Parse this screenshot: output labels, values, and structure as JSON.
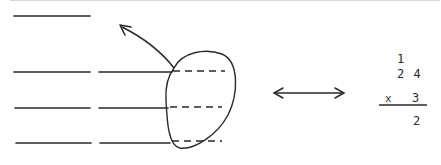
{
  "diagram": {
    "stroke_color": "#2a2a2a",
    "lines": {
      "top_single": 1,
      "rows": 3,
      "row_segments_each": 2,
      "dashed_inside_loop": 3
    },
    "arrows": {
      "curved": "up-left out of loop",
      "double": "equivalence left-right"
    },
    "multiplication": {
      "carry": "1",
      "multiplicand": "2 4",
      "operator": "x",
      "multiplier": "3",
      "result_partial": "2"
    }
  }
}
